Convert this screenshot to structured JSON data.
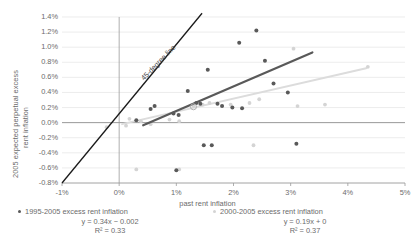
{
  "chart_data": {
    "type": "scatter",
    "title": "",
    "xlabel": "past rent inflation",
    "ylabel_line1": "2005 expected perpetual excess",
    "ylabel_line2": "rent inflation",
    "xlim": [
      -1.0,
      5.0
    ],
    "ylim": [
      -0.8,
      1.4
    ],
    "xticks": [
      "-1%",
      "0%",
      "1%",
      "2%",
      "3%",
      "4%",
      "5%"
    ],
    "xtick_values": [
      -1,
      0,
      1,
      2,
      3,
      4,
      5
    ],
    "yticks": [
      "1.4%",
      "1.2%",
      "1.0%",
      "0.8%",
      "0.6%",
      "0.4%",
      "0.2%",
      "0.0%",
      "-0.2%",
      "-0.4%",
      "-0.6%",
      "-0.8%"
    ],
    "ytick_values": [
      1.4,
      1.2,
      1.0,
      0.8,
      0.6,
      0.4,
      0.2,
      0.0,
      -0.2,
      -0.4,
      -0.6,
      -0.8
    ],
    "grid": true,
    "legend_position": "bottom",
    "annotations": [
      {
        "text": "45-degree line",
        "x": 0.35,
        "y": 0.62,
        "rotation": -46
      }
    ],
    "reference_lines": [
      {
        "name": "45-degree line",
        "type": "identity",
        "x0": -1.0,
        "y0": -0.8,
        "x1": 1.45,
        "y1": 1.45,
        "color": "#1a1a1a",
        "width": 1.3
      }
    ],
    "series": [
      {
        "name": "1995-2005 excess rent inflation",
        "color": "#595959",
        "marker": "circle",
        "equation": "y = 0.34x − 0.002",
        "equation_slope": 0.34,
        "equation_intercept": -0.002,
        "r2_label": "R² = 0.33",
        "r2": 0.33,
        "trendline": {
          "x0": 0.42,
          "y0": -0.035,
          "x1": 3.38,
          "y1": 0.93,
          "color": "#595959",
          "width": 2.2
        },
        "points": [
          {
            "x": 0.3,
            "y": 0.03
          },
          {
            "x": 0.55,
            "y": 0.18
          },
          {
            "x": 0.62,
            "y": 0.22
          },
          {
            "x": 0.95,
            "y": 0.12
          },
          {
            "x": 1.04,
            "y": 0.1
          },
          {
            "x": 1.2,
            "y": 0.42
          },
          {
            "x": 1.35,
            "y": 0.26
          },
          {
            "x": 1.42,
            "y": 0.25
          },
          {
            "x": 1.48,
            "y": -0.3
          },
          {
            "x": 1.62,
            "y": -0.3
          },
          {
            "x": 1.55,
            "y": 0.7
          },
          {
            "x": 1.72,
            "y": 0.25
          },
          {
            "x": 1.8,
            "y": 0.22
          },
          {
            "x": 1.98,
            "y": 0.2
          },
          {
            "x": 2.1,
            "y": 1.06
          },
          {
            "x": 2.15,
            "y": 0.19
          },
          {
            "x": 2.4,
            "y": 1.22
          },
          {
            "x": 2.55,
            "y": 0.82
          },
          {
            "x": 2.7,
            "y": 0.52
          },
          {
            "x": 2.95,
            "y": 0.4
          },
          {
            "x": 3.1,
            "y": -0.28
          },
          {
            "x": 1.0,
            "y": -0.63
          }
        ]
      },
      {
        "name": "2000-2005 excess rent inflation",
        "color": "#d4d4d4",
        "marker": "circle",
        "equation": "y = 0.19x + 0",
        "equation_slope": 0.19,
        "equation_intercept": 0,
        "r2_label": "R² = 0.37",
        "r2": 0.37,
        "trendline": {
          "x0": 0.05,
          "y0": -0.02,
          "x1": 4.32,
          "y1": 0.72,
          "color": "#dcdcdc",
          "width": 2.0
        },
        "points": [
          {
            "x": -0.22,
            "y": -0.06
          },
          {
            "x": 0.12,
            "y": -0.04
          },
          {
            "x": 0.38,
            "y": 0.02
          },
          {
            "x": 0.55,
            "y": -0.02
          },
          {
            "x": 0.88,
            "y": 0.04
          },
          {
            "x": 1.05,
            "y": 0.02
          },
          {
            "x": 1.3,
            "y": 0.22
          },
          {
            "x": 1.46,
            "y": 0.24
          },
          {
            "x": 1.58,
            "y": 0.26
          },
          {
            "x": 1.95,
            "y": 0.24
          },
          {
            "x": 2.28,
            "y": 0.26
          },
          {
            "x": 2.45,
            "y": 0.31
          },
          {
            "x": 3.05,
            "y": 0.98
          },
          {
            "x": 3.12,
            "y": 0.22
          },
          {
            "x": 3.6,
            "y": 0.24
          },
          {
            "x": 4.35,
            "y": 0.74
          },
          {
            "x": 1.05,
            "y": -0.62
          },
          {
            "x": 0.3,
            "y": -0.62
          },
          {
            "x": 2.35,
            "y": -0.3
          },
          {
            "x": 0.18,
            "y": 0.05
          }
        ]
      }
    ]
  }
}
